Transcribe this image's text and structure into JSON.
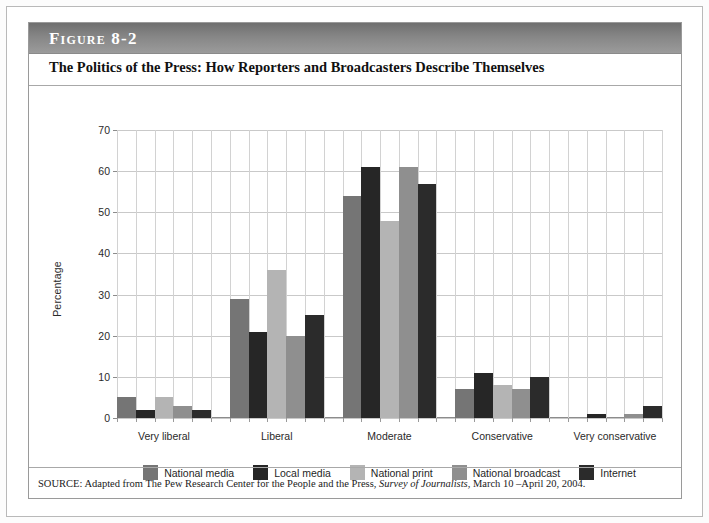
{
  "figure": {
    "band_label": "Figure 8-2",
    "title": "The Politics of the Press: How Reporters and Broadcasters Describe Themselves",
    "source_prefix": "SOURCE: Adapted from The Pew Research Center for the People and the Press, ",
    "source_italic": "Survey of Journalists",
    "source_suffix": ", March 10 –April 20, 2004."
  },
  "colors": {
    "national_media": "#757575",
    "local_media": "#262626",
    "national_print": "#b4b4b4",
    "national_broadcast": "#8f8f8f",
    "internet": "#2b2b2b",
    "gridline": "#c9c9c9",
    "axis": "#8c8c8c",
    "band_dark": "#6f6f6f",
    "band_light": "#9b9b9b",
    "page_background": "#ffffff"
  },
  "chart_data": {
    "type": "bar",
    "title": "The Politics of the Press: How Reporters and Broadcasters Describe Themselves",
    "xlabel": "",
    "ylabel": "Percentage",
    "ylim": [
      0,
      70
    ],
    "yticks": [
      0,
      10,
      20,
      30,
      40,
      50,
      60,
      70
    ],
    "grid": true,
    "legend_position": "bottom",
    "categories": [
      "Very liberal",
      "Liberal",
      "Moderate",
      "Conservative",
      "Very conservative"
    ],
    "series": [
      {
        "name": "National media",
        "color": "#757575",
        "values": [
          5,
          29,
          54,
          7,
          0
        ]
      },
      {
        "name": "Local media",
        "color": "#262626",
        "values": [
          2,
          21,
          61,
          11,
          1
        ]
      },
      {
        "name": "National print",
        "color": "#b4b4b4",
        "values": [
          5,
          36,
          48,
          8,
          0
        ]
      },
      {
        "name": "National broadcast",
        "color": "#8f8f8f",
        "values": [
          3,
          20,
          61,
          7,
          1
        ]
      },
      {
        "name": "Internet",
        "color": "#2b2b2b",
        "values": [
          2,
          25,
          57,
          10,
          3
        ]
      }
    ]
  }
}
